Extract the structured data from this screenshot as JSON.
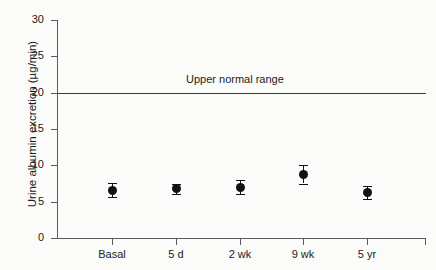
{
  "chart_data": {
    "type": "scatter",
    "title": "",
    "xlabel": "",
    "ylabel": "Urine albumin excretion (µg/min)",
    "categories": [
      "Basal",
      "5 d",
      "2 wk",
      "9 wk",
      "5 yr"
    ],
    "values": [
      6.6,
      6.8,
      7.0,
      8.8,
      6.2
    ],
    "errors": [
      1.0,
      0.7,
      1.0,
      1.3,
      0.9
    ],
    "ylim": [
      0,
      30
    ],
    "yticks": [
      0,
      5,
      10,
      15,
      20,
      25,
      30
    ],
    "ytick_labels": [
      "0",
      "5",
      "10",
      "15",
      "20",
      "25",
      "30"
    ],
    "grid": false,
    "legend": "none",
    "annotations": [
      {
        "text": "Upper normal range",
        "y": 20,
        "type": "reference-line-label"
      }
    ],
    "reference_line": {
      "label": "Upper normal range",
      "y": 20
    },
    "marker_style": "filled-circle",
    "error_bar_style": "capped",
    "colors": {
      "marker": "#111111",
      "axis": "#5a5a5a",
      "reference_line": "#3a3a3a",
      "background": "#fbfbf9",
      "text": "#1c1c1c"
    }
  }
}
